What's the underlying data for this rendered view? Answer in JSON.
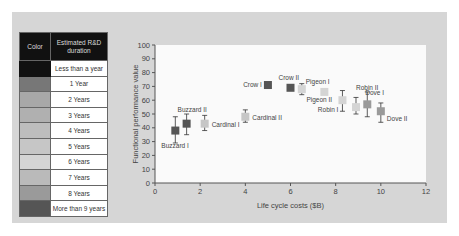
{
  "legend": {
    "header_color": "Color",
    "header_duration": "Estimated R&D duration",
    "rows": [
      {
        "label": "Less than a year",
        "color": "#111111"
      },
      {
        "label": "1 Year",
        "color": "#777777"
      },
      {
        "label": "2 Years",
        "color": "#a8a8a8"
      },
      {
        "label": "3 Years",
        "color": "#b0b0b0"
      },
      {
        "label": "4 Years",
        "color": "#bdbdbd"
      },
      {
        "label": "5 Years",
        "color": "#c6c6c6"
      },
      {
        "label": "6 Years",
        "color": "#d4d4d4"
      },
      {
        "label": "7 Years",
        "color": "#bababa"
      },
      {
        "label": "8 Years",
        "color": "#9a9a9a"
      },
      {
        "label": "More than 9 years",
        "color": "#555555"
      }
    ]
  },
  "chart_data": {
    "type": "scatter",
    "title": "",
    "xlabel": "Life cycle costs ($B)",
    "ylabel": "Functional performance value",
    "xlim": [
      0,
      12
    ],
    "ylim": [
      0,
      100
    ],
    "xticks": [
      0,
      2,
      4,
      6,
      8,
      10,
      12
    ],
    "yticks": [
      0,
      10,
      20,
      30,
      40,
      50,
      60,
      70,
      80,
      90,
      100
    ],
    "grid": false,
    "legend_position": "left table",
    "points": [
      {
        "name": "Buzzard I",
        "x": 0.9,
        "y": 38,
        "err_low": 29,
        "err_high": 48,
        "color": "#555555"
      },
      {
        "name": "Buzzard II",
        "x": 1.4,
        "y": 43,
        "err_low": 35,
        "err_high": 50,
        "color": "#555555"
      },
      {
        "name": "Cardinal I",
        "x": 2.2,
        "y": 43,
        "err_low": 38,
        "err_high": 49,
        "color": "#c6c6c6"
      },
      {
        "name": "Cardinal II",
        "x": 4.0,
        "y": 48,
        "err_low": 44,
        "err_high": 53,
        "color": "#c6c6c6"
      },
      {
        "name": "Crow I",
        "x": 5.0,
        "y": 71,
        "err_low": null,
        "err_high": null,
        "color": "#555555"
      },
      {
        "name": "Crow II",
        "x": 6.0,
        "y": 69,
        "err_low": null,
        "err_high": null,
        "color": "#555555"
      },
      {
        "name": "Pigeon I",
        "x": 6.5,
        "y": 68,
        "err_low": 64,
        "err_high": 72,
        "color": "#d4d4d4"
      },
      {
        "name": "Pigeon II",
        "x": 7.5,
        "y": 66,
        "err_low": null,
        "err_high": null,
        "color": "#d4d4d4"
      },
      {
        "name": "Robin I",
        "x": 8.3,
        "y": 60,
        "err_low": 52,
        "err_high": 67,
        "color": "#d4d4d4"
      },
      {
        "name": "Robin II",
        "x": 8.9,
        "y": 55,
        "err_low": 50,
        "err_high": 62,
        "color": "#d4d4d4"
      },
      {
        "name": "Dove I",
        "x": 9.4,
        "y": 57,
        "err_low": 48,
        "err_high": 66,
        "color": "#9a9a9a"
      },
      {
        "name": "Dove II",
        "x": 10.0,
        "y": 52,
        "err_low": 44,
        "err_high": 58,
        "color": "#9a9a9a"
      }
    ]
  }
}
